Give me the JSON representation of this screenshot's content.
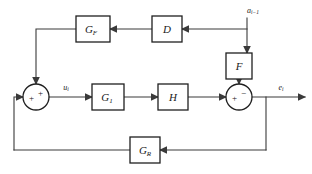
{
  "diagram": {
    "type": "control-system-block-diagram",
    "colors": {
      "background": "#ffffff",
      "wire": "#3a3a3a",
      "block_stroke": "#1f1f1f",
      "block_fill": "#ffffff",
      "text": "#1a1a1a"
    },
    "blocks": [
      {
        "id": "gf",
        "label": "G",
        "subscript": "F",
        "x": 76,
        "y": 16,
        "w": 34,
        "h": 26
      },
      {
        "id": "d",
        "label": "D",
        "subscript": "",
        "x": 152,
        "y": 16,
        "w": 30,
        "h": 26
      },
      {
        "id": "f",
        "label": "F",
        "subscript": "",
        "x": 226,
        "y": 53,
        "w": 26,
        "h": 26
      },
      {
        "id": "g1",
        "label": "G",
        "subscript": "1",
        "x": 92,
        "y": 84,
        "w": 32,
        "h": 26
      },
      {
        "id": "h",
        "label": "H",
        "subscript": "",
        "x": 158,
        "y": 84,
        "w": 30,
        "h": 26
      },
      {
        "id": "gr",
        "label": "G",
        "subscript": "R",
        "x": 130,
        "y": 137,
        "w": 30,
        "h": 26
      }
    ],
    "summing_junctions": [
      {
        "id": "sum-left",
        "cx": 36,
        "cy": 97,
        "r": 13,
        "signs": [
          {
            "text": "+",
            "dx": -4.5,
            "dy": 1.5
          },
          {
            "text": "+",
            "dx": 4.5,
            "dy": -3.5
          }
        ]
      },
      {
        "id": "sum-right",
        "cx": 239,
        "cy": 97,
        "r": 13,
        "signs": [
          {
            "text": "+",
            "dx": -4.5,
            "dy": 1.5
          },
          {
            "text": "−",
            "dx": 4.5,
            "dy": -3.5
          }
        ]
      }
    ],
    "signals": [
      {
        "id": "disturbance-input",
        "label": "a",
        "subscript": "i−1",
        "x": 253,
        "y": 11
      },
      {
        "id": "control-signal",
        "label": "u",
        "subscript": "i",
        "x": 66,
        "y": 88
      },
      {
        "id": "output-signal",
        "label": "e",
        "subscript": "i",
        "x": 281,
        "y": 88
      }
    ],
    "wire_paths": {
      "disturbance_trunk": "M 247 18 L 247 53",
      "disturbance_to_d": "M 247 29 L 182 29",
      "d_to_gf": "M 152 29 L 110 29",
      "gf_to_sum_left": "M 76 29 L 36 29 L 36 84",
      "f_to_sum_right": "M 239 79 L 239 84",
      "sum_left_to_g1": "M 49 97 L 92 97",
      "g1_to_h": "M 124 97 L 158 97",
      "h_to_sum_right": "M 188 97 L 226 97",
      "sum_right_to_output": "M 252 97 L 305 97",
      "feedback_tap_down": "M 266 97 L 266 150",
      "feedback_to_gr": "M 266 150 L 160 150",
      "gr_to_left": "M 130 150 L 14 150",
      "feedback_up_to_sum": "M 14 150 L 14 97 L 23 97"
    },
    "arrow_heads": [
      {
        "id": "arrow-disturbance-into-f",
        "x": 247,
        "y": 53,
        "dir": "down"
      },
      {
        "id": "arrow-into-d",
        "x": 182,
        "y": 29,
        "dir": "left"
      },
      {
        "id": "arrow-into-gf",
        "x": 110,
        "y": 29,
        "dir": "left"
      },
      {
        "id": "arrow-gf-into-sum-left",
        "x": 36,
        "y": 84,
        "dir": "down"
      },
      {
        "id": "arrow-f-into-sum-right",
        "x": 239,
        "y": 84,
        "dir": "down"
      },
      {
        "id": "arrow-into-g1",
        "x": 92,
        "y": 97,
        "dir": "right"
      },
      {
        "id": "arrow-into-h",
        "x": 158,
        "y": 97,
        "dir": "right"
      },
      {
        "id": "arrow-into-sum-right",
        "x": 226,
        "y": 97,
        "dir": "right"
      },
      {
        "id": "arrow-output",
        "x": 305,
        "y": 97,
        "dir": "right"
      },
      {
        "id": "arrow-into-gr",
        "x": 160,
        "y": 150,
        "dir": "left"
      },
      {
        "id": "arrow-into-sum-left-fb",
        "x": 23,
        "y": 97,
        "dir": "right"
      }
    ]
  }
}
